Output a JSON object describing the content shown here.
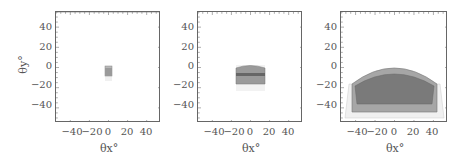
{
  "chart_data": [
    {
      "type": "area",
      "panel": 1,
      "xlabel": "θx°",
      "ylabel": "θy°",
      "xlim": [
        -55,
        55
      ],
      "ylim": [
        -55,
        55
      ],
      "xticks": [
        "−40",
        "−20",
        "0",
        "20",
        "40"
      ],
      "yticks": [
        "40",
        "20",
        "0",
        "−20",
        "−40"
      ],
      "regions": [
        {
          "name": "outer-light",
          "x": [
            -3,
            3
          ],
          "y": [
            -13,
            2
          ],
          "fill": "#f0f0f0"
        },
        {
          "name": "mid",
          "x": [
            -3,
            3
          ],
          "y": [
            -7,
            2
          ],
          "fill": "#b8b8b8"
        },
        {
          "name": "dark",
          "x": [
            -3,
            3
          ],
          "y": [
            -7,
            0
          ],
          "fill": "#9a9a9a"
        }
      ]
    },
    {
      "type": "area",
      "panel": 2,
      "xlabel": "θx°",
      "ylabel": "",
      "xlim": [
        -55,
        55
      ],
      "ylim": [
        -55,
        55
      ],
      "xticks": [
        "−40",
        "−20",
        "0",
        "20",
        "40"
      ],
      "yticks": [
        "40",
        "20",
        "0",
        "−20",
        "−40"
      ],
      "regions": [
        {
          "name": "outer-light",
          "x": [
            -14,
            14
          ],
          "y": [
            -23,
            2
          ],
          "fill": "#f0f0f0"
        },
        {
          "name": "mid",
          "x": [
            -14,
            14
          ],
          "y": [
            -16,
            2
          ],
          "fill": "#9a9a9a"
        },
        {
          "name": "dark-band",
          "x": [
            -14,
            14
          ],
          "y": [
            -9,
            -6
          ],
          "fill": "#6a6a6a"
        }
      ]
    },
    {
      "type": "area",
      "panel": 3,
      "xlabel": "θx°",
      "ylabel": "",
      "xlim": [
        -55,
        55
      ],
      "ylim": [
        -55,
        55
      ],
      "xticks": [
        "−40",
        "−20",
        "0",
        "20",
        "40"
      ],
      "yticks": [
        "40",
        "20",
        "0",
        "−20",
        "−40"
      ],
      "regions": [
        {
          "name": "outer-light",
          "x": [
            -50,
            50
          ],
          "y": [
            -52,
            -20
          ],
          "fill": "#f0f0f0"
        },
        {
          "name": "mid-dome",
          "x": [
            -44,
            44
          ],
          "y": [
            -46,
            2
          ],
          "fill": "#a6a6a6"
        },
        {
          "name": "inner-dome",
          "x": [
            -41,
            41
          ],
          "y": [
            -38,
            -6
          ],
          "fill": "#7a7a7a"
        }
      ]
    }
  ],
  "labels": {
    "ytitle": "θy°",
    "xtitle": "θx°",
    "yticks": [
      "40",
      "20",
      "0",
      "−20",
      "−40"
    ],
    "xticks": [
      "−40",
      "−20",
      "0",
      "20",
      "40"
    ]
  }
}
